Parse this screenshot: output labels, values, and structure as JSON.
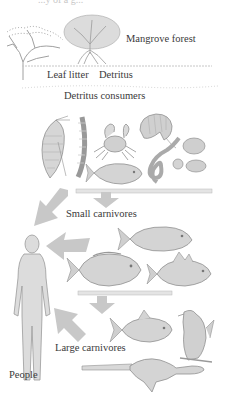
{
  "diagram": {
    "title_partial": "...y of a g...",
    "labels": {
      "mangrove_forest": "Mangrove forest",
      "leaf_litter": "Leaf litter",
      "detritus": "Detritus",
      "detritus_consumers": "Detritus consumers",
      "small_carnivores": "Small carnivores",
      "large_carnivores": "Large carnivores",
      "people": "People"
    },
    "levels": [
      {
        "name": "Mangrove forest",
        "organisms": [
          "dry tree",
          "mangrove tree"
        ]
      },
      {
        "name": "Detritus",
        "items": [
          "Leaf litter",
          "Detritus"
        ]
      },
      {
        "name": "Detritus consumers",
        "organisms": [
          "shrimp",
          "worm",
          "crab",
          "prawn",
          "small fish",
          "eel-like worm",
          "clams"
        ]
      },
      {
        "name": "Small carnivores",
        "organisms": [
          "fish",
          "fish",
          "fish"
        ]
      },
      {
        "name": "Large carnivores",
        "organisms": [
          "fish",
          "bird of prey",
          "sawfish"
        ]
      },
      {
        "name": "People",
        "organisms": [
          "human"
        ]
      }
    ],
    "arrows": [
      {
        "from": "Detritus consumers",
        "to": "Small carnivores",
        "direction": "down"
      },
      {
        "from": "Detritus consumers",
        "to": "People",
        "direction": "down-left"
      },
      {
        "from": "Small carnivores",
        "to": "People",
        "direction": "left"
      },
      {
        "from": "Small carnivores",
        "to": "Large carnivores",
        "direction": "down"
      },
      {
        "from": "Large carnivores",
        "to": "People",
        "direction": "up-left"
      }
    ],
    "colors": {
      "arrow": "#c8c8c8",
      "drawing": "#9a9a9a",
      "text": "#3a3a3a"
    }
  }
}
